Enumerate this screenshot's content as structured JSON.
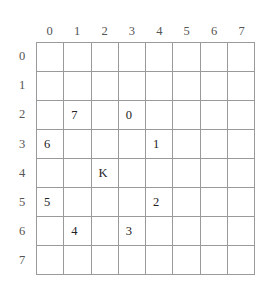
{
  "grid": {
    "rows": 8,
    "cols": 8,
    "column_headers": [
      "0",
      "1",
      "2",
      "3",
      "4",
      "5",
      "6",
      "7"
    ],
    "row_headers": [
      "0",
      "1",
      "2",
      "3",
      "4",
      "5",
      "6",
      "7"
    ],
    "line_color": "#9a9a9a",
    "header_color": "#555555",
    "value_color": "#222222",
    "cell_background": "#ffffff",
    "cells": [
      [
        "",
        "",
        "",
        "",
        "",
        "",
        "",
        ""
      ],
      [
        "",
        "",
        "",
        "",
        "",
        "",
        "",
        ""
      ],
      [
        "",
        "7",
        "",
        "0",
        "",
        "",
        "",
        ""
      ],
      [
        "6",
        "",
        "",
        "",
        "1",
        "",
        "",
        ""
      ],
      [
        "",
        "",
        "K",
        "",
        "",
        "",
        "",
        ""
      ],
      [
        "5",
        "",
        "",
        "",
        "2",
        "",
        "",
        ""
      ],
      [
        "",
        "4",
        "",
        "3",
        "",
        "",
        "",
        ""
      ],
      [
        "",
        "",
        "",
        "",
        "",
        "",
        "",
        ""
      ]
    ]
  }
}
